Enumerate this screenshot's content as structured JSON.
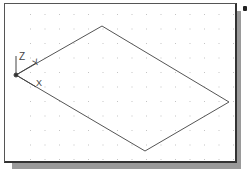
{
  "viewport": {
    "background": "#ffffff",
    "border_color": "#444444",
    "shadow_color": "#9a9a9a",
    "grid_color": "#c8c8c8"
  },
  "ucs_icon": {
    "axis_labels": {
      "x": "X",
      "y": "Y",
      "z": "Z"
    }
  },
  "drawing": {
    "shape": "parallelogram",
    "line_color": "#555555"
  }
}
